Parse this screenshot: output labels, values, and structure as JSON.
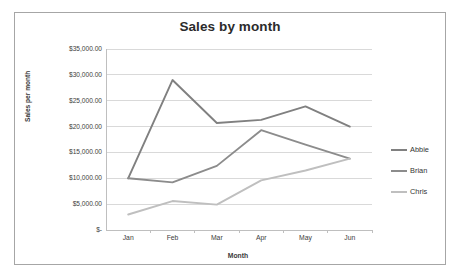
{
  "chart_data": {
    "type": "line",
    "title": "Sales by month",
    "xlabel": "Month",
    "ylabel": "Sales per month",
    "categories": [
      "Jan",
      "Feb",
      "Mar",
      "Apr",
      "May",
      "Jun"
    ],
    "ylim": [
      0,
      35000
    ],
    "ytick_step": 5000,
    "ytick_labels": [
      "$35,000.00",
      "$30,000.00",
      "$25,000.00",
      "$20,000.00",
      "$15,000.00",
      "$10,000.00",
      "$5,000.00",
      "$-"
    ],
    "ytick_values": [
      35000,
      30000,
      25000,
      20000,
      15000,
      10000,
      5000,
      0
    ],
    "grid": "horizontal",
    "legend_position": "right",
    "series": [
      {
        "name": "Abbie",
        "color": "#808080",
        "values": [
          10000,
          29000,
          20700,
          21300,
          23900,
          20000
        ]
      },
      {
        "name": "Brian",
        "color": "#8c8c8c",
        "values": [
          10000,
          9200,
          12400,
          19300,
          16500,
          13800
        ]
      },
      {
        "name": "Chris",
        "color": "#bfbfbf",
        "values": [
          3000,
          5600,
          4900,
          9600,
          11500,
          13800
        ]
      }
    ]
  },
  "colors": {
    "frame_border": "#a6a6a6",
    "gridline": "#d9d9d9",
    "axis_line": "#bfbfbf",
    "title_text": "#2b2b2b",
    "tick_text": "#3d3d3d"
  }
}
